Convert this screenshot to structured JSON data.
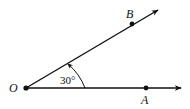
{
  "diagram": {
    "type": "angle",
    "vertex": {
      "label": "O",
      "x": 26,
      "y": 88
    },
    "rays": [
      {
        "name": "ray-OA",
        "through": "A",
        "end": {
          "x": 181,
          "y": 88
        }
      },
      {
        "name": "ray-OB",
        "through": "B",
        "end": {
          "x": 158,
          "y": 10
        }
      }
    ],
    "points": [
      {
        "label": "O",
        "x": 26,
        "y": 88,
        "label_x": 9,
        "label_y": 92
      },
      {
        "label": "A",
        "x": 146,
        "y": 88,
        "label_x": 141,
        "label_y": 104
      },
      {
        "label": "B",
        "x": 132,
        "y": 24,
        "label_x": 126,
        "label_y": 18
      }
    ],
    "angle": {
      "label": "30°",
      "value_deg": 30,
      "from": "OA",
      "to": "OB",
      "label_x": 60,
      "label_y": 84
    },
    "colors": {
      "stroke": "#111111",
      "background": "#ffffff"
    }
  }
}
